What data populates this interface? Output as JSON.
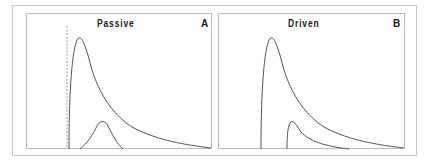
{
  "figure": {
    "panels": [
      {
        "id": "A",
        "title": "Passive",
        "letter": "A",
        "curves": [
          {
            "name": "main-response",
            "description": "sharp rise then long exponential-like decay"
          },
          {
            "name": "secondary-bump",
            "description": "small gaussian-like bump, delayed"
          }
        ],
        "marker": {
          "type": "dashed-vertical-line",
          "description": "onset marker"
        }
      },
      {
        "id": "B",
        "title": "Driven",
        "letter": "B",
        "curves": [
          {
            "name": "main-response",
            "description": "sharp rise then long decay"
          },
          {
            "name": "secondary-response",
            "description": "small delayed sharp rise then decay"
          }
        ]
      }
    ],
    "colors": {
      "curve": "#555555",
      "frame": "#c8c8c8",
      "marker": "#9a9a9a"
    }
  }
}
